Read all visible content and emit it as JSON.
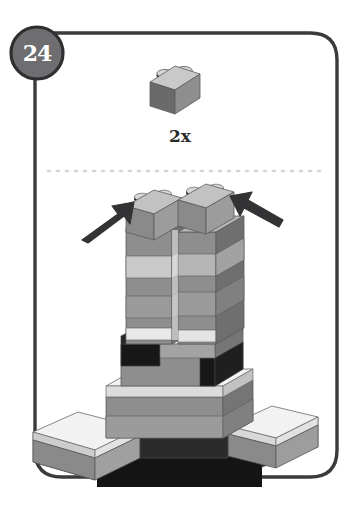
{
  "card": {
    "step_badge": "24",
    "frame_color": "#3b3b3d",
    "badge_fill": "#6e6e70",
    "badge_stroke": "#2f2f31",
    "badge_text_color": "#ffffff",
    "background": "#ffffff"
  },
  "parts_callout": {
    "quantity_label": "2x",
    "part_name": "brick-1x2",
    "stud_count": 2,
    "colors": {
      "top": "#c9c9c9",
      "front": "#8e8e8e",
      "side": "#6a6a6a",
      "stud_top": "#d8d8d8",
      "stud_shadow": "#1c1c1c"
    }
  },
  "divider": {
    "name": "dotted-separator",
    "color": "#d6d6d6",
    "dash": "2 7"
  },
  "arrows": {
    "color": "#333335",
    "left": {
      "name": "placement-arrow-left",
      "direction": "up-right"
    },
    "right": {
      "name": "placement-arrow-right",
      "direction": "up-left"
    }
  },
  "model": {
    "name": "lego-tower-assembly",
    "description": "twin towers on stepped base",
    "palette": {
      "white_top": "#f2f2f2",
      "white_front": "#e2e2e2",
      "white_side": "#cdcdcd",
      "light_top": "#d2d2d2",
      "light_front": "#bdbdbd",
      "light_side": "#a2a2a2",
      "mid_top": "#a8a8a8",
      "mid_front": "#8e8e8e",
      "mid_side": "#767676",
      "dark_top": "#4a4a4a",
      "dark_front": "#3a3a3a",
      "dark_side": "#2a2a2a",
      "black_top": "#262626",
      "black_front": "#171717",
      "black_side": "#0d0d0d",
      "stud_top": "#d8d8d8",
      "stud_shadow": "#1b1b1b",
      "outline": "#5a5a5a"
    }
  }
}
